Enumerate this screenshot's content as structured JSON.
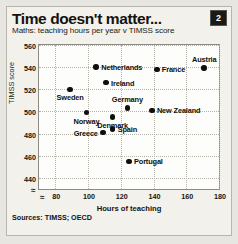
{
  "header": {
    "title": "Time doesn't matter...",
    "badge": "2",
    "subtitle": "Maths: teaching hours per year v TIMSS score"
  },
  "footer": {
    "source": "Sources: TIMSS; OECD"
  },
  "axis_break_glyph": "≈",
  "chart_data": {
    "type": "scatter",
    "title": "Time doesn't matter...",
    "subtitle": "Maths: teaching hours per year v TIMSS score",
    "xlabel": "Hours of teaching",
    "ylabel": "TIMSS score",
    "xlim": [
      70,
      180
    ],
    "ylim": [
      430,
      560
    ],
    "xticks": [
      80,
      100,
      120,
      140,
      160,
      180
    ],
    "yticks": [
      440,
      460,
      480,
      500,
      520,
      540,
      560
    ],
    "grid": true,
    "legend": "none",
    "axis_break_x": true,
    "axis_break_y": true,
    "points": [
      {
        "label": "Netherlands",
        "x": 105,
        "y": 540,
        "label_pos": "right"
      },
      {
        "label": "Austria",
        "x": 171,
        "y": 539,
        "label_pos": "above"
      },
      {
        "label": "France",
        "x": 142,
        "y": 538,
        "label_pos": "right"
      },
      {
        "label": "Ireland",
        "x": 111,
        "y": 526,
        "label_pos": "right"
      },
      {
        "label": "Sweden",
        "x": 89,
        "y": 520,
        "label_pos": "below"
      },
      {
        "label": "Germany",
        "x": 124,
        "y": 503,
        "label_pos": "above"
      },
      {
        "label": "New Zealand",
        "x": 139,
        "y": 501,
        "label_pos": "right"
      },
      {
        "label": "Norway",
        "x": 99,
        "y": 499,
        "label_pos": "below"
      },
      {
        "label": "Denmark",
        "x": 115,
        "y": 495,
        "label_pos": "below"
      },
      {
        "label": "Spain",
        "x": 115,
        "y": 484,
        "label_pos": "right"
      },
      {
        "label": "Greece",
        "x": 109,
        "y": 481,
        "label_pos": "left"
      },
      {
        "label": "Portugal",
        "x": 125,
        "y": 455,
        "label_pos": "right"
      }
    ]
  }
}
